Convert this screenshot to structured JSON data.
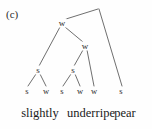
{
  "figure": {
    "caption": "(c)",
    "type": "syntax-tree"
  },
  "tree": {
    "root": {
      "label": "",
      "x": 98,
      "y": 8
    },
    "internal_nodes": [
      {
        "id": "w1",
        "label": "w",
        "x": 62,
        "y": 23
      },
      {
        "id": "w2",
        "label": "w",
        "x": 85,
        "y": 46
      },
      {
        "id": "s1",
        "label": "s",
        "x": 38,
        "y": 70
      },
      {
        "id": "s2",
        "label": "s",
        "x": 73,
        "y": 70
      }
    ],
    "leaf_nodes": [
      {
        "id": "l1",
        "label": "s",
        "x": 27,
        "y": 91
      },
      {
        "id": "l2",
        "label": "w",
        "x": 46,
        "y": 91
      },
      {
        "id": "l3",
        "label": "s",
        "x": 62,
        "y": 91
      },
      {
        "id": "l4",
        "label": "w",
        "x": 80,
        "y": 91
      },
      {
        "id": "l5",
        "label": "w",
        "x": 94,
        "y": 91
      },
      {
        "id": "l6",
        "label": "s",
        "x": 121,
        "y": 91
      }
    ],
    "edges": [
      {
        "from": "root",
        "to": "w1",
        "x1": 98,
        "y1": 9,
        "x2": 66,
        "y2": 19
      },
      {
        "from": "root",
        "to": "l6",
        "x1": 99,
        "y1": 9,
        "x2": 122,
        "y2": 86
      },
      {
        "from": "w1",
        "to": "s1",
        "x1": 60,
        "y1": 27,
        "x2": 39,
        "y2": 66
      },
      {
        "from": "w1",
        "to": "w2",
        "x1": 65,
        "y1": 27,
        "x2": 83,
        "y2": 42
      },
      {
        "from": "w2",
        "to": "s2",
        "x1": 83,
        "y1": 50,
        "x2": 74,
        "y2": 66
      },
      {
        "from": "w2",
        "to": "l5",
        "x1": 87,
        "y1": 50,
        "x2": 94,
        "y2": 86
      },
      {
        "from": "s1",
        "to": "l1",
        "x1": 36,
        "y1": 74,
        "x2": 28,
        "y2": 86
      },
      {
        "from": "s1",
        "to": "l2",
        "x1": 40,
        "y1": 74,
        "x2": 46,
        "y2": 86
      },
      {
        "from": "s2",
        "to": "l3",
        "x1": 71,
        "y1": 74,
        "x2": 63,
        "y2": 86
      },
      {
        "from": "s2",
        "to": "l4",
        "x1": 75,
        "y1": 74,
        "x2": 80,
        "y2": 86
      }
    ]
  },
  "words": [
    {
      "id": "word1",
      "text": "slightly",
      "x": 40,
      "y": 113
    },
    {
      "id": "word2",
      "text": "underripe",
      "x": 91,
      "y": 113
    },
    {
      "id": "word3",
      "text": "pear",
      "x": 125,
      "y": 113
    }
  ],
  "style": {
    "line_color": "#4a4a4a",
    "text_color": "#1a1a1a",
    "background": "#fefefe"
  }
}
